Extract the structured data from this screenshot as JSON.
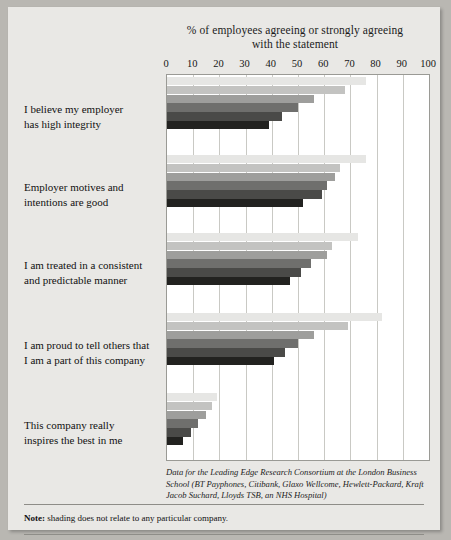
{
  "chart_data": {
    "type": "bar",
    "orientation": "horizontal",
    "title": "% of employees agreeing or strongly agreeing with the statement",
    "title_line1": "% of employees agreeing or strongly agreeing",
    "title_line2": "with the statement",
    "xlabel": "",
    "ylabel": "",
    "xlim": [
      0,
      100
    ],
    "xticks": [
      0,
      10,
      20,
      30,
      40,
      50,
      60,
      70,
      80,
      90,
      100
    ],
    "grid": true,
    "legend": "none",
    "series_note": "6 unlabelled company series per statement, shaded light to dark",
    "shades": [
      "#e6e6e4",
      "#c3c3c1",
      "#9e9e9c",
      "#6f6f6d",
      "#4a4a48",
      "#222220"
    ],
    "categories": [
      "I believe my employer has high integrity",
      "Employer motives and intentions are good",
      "I am treated in a consistent and predictable manner",
      "I am proud to tell others that I am a part of this company",
      "This company really inspires the best in me"
    ],
    "groups": [
      {
        "label_line1": "I believe my employer",
        "label_line2": "has high integrity",
        "values": [
          76,
          68,
          56,
          50,
          44,
          39
        ]
      },
      {
        "label_line1": "Employer motives and",
        "label_line2": "intentions are good",
        "values": [
          76,
          66,
          64,
          61,
          59,
          52
        ]
      },
      {
        "label_line1": "I am treated in a consistent",
        "label_line2": "and predictable manner",
        "values": [
          73,
          63,
          61,
          55,
          51,
          47
        ]
      },
      {
        "label_line1": "I am proud to tell others that",
        "label_line2": "I am a part of this company",
        "values": [
          82,
          69,
          56,
          50,
          45,
          41
        ]
      },
      {
        "label_line1": "This company really",
        "label_line2": "inspires the best in me",
        "values": [
          19,
          17,
          15,
          12,
          9,
          6
        ]
      }
    ]
  },
  "source_note": "Data for the Leading Edge Research Consortium at the London Business School (BT Payphones, Citibank, Glaxo Wellcome, Hewlett-Packard, Kraft Jacob Suchard, Lloyds TSB, an NHS Hospital)",
  "bottom_note": {
    "prefix": "Note:",
    "text": " shading does not relate to any particular company."
  },
  "colors": {
    "page_background": "#b9b7b2",
    "card_background": "#e9e8e5",
    "plot_background": "#ffffff",
    "gridline": "#c9c9c4",
    "text": "#111111"
  }
}
